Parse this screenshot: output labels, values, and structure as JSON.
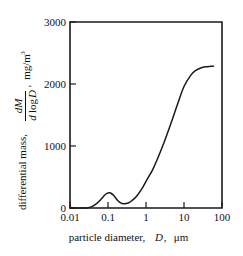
{
  "chart_data": {
    "type": "line",
    "title": "",
    "subtitle": "",
    "xlabel_parts": {
      "prefix": "particle diameter,",
      "symbol": "D",
      "comma": ",",
      "unit": "μm"
    },
    "xlabel": "particle diameter, D, μm",
    "ylabel_parts": {
      "prefix": "differential mass,",
      "numerator": "dM",
      "denominator_d": "d",
      "denominator_log": "log",
      "denominator_D": "D",
      "comma": ",",
      "unit_base": "mg/m",
      "unit_exponent": "3"
    },
    "ylabel": "differential mass, dM / d log D , mg/m3",
    "xscale": "log",
    "yscale": "linear",
    "xlim": [
      0.01,
      100
    ],
    "ylim": [
      0,
      3000
    ],
    "xticks": [
      "0.01",
      "0.1",
      "1",
      "10",
      "100"
    ],
    "xtick_values": [
      0.01,
      0.1,
      1,
      10,
      100
    ],
    "yticks": [
      "0",
      "1000",
      "2000",
      "3000"
    ],
    "ytick_values": [
      0,
      1000,
      2000,
      3000
    ],
    "grid": false,
    "legend": false,
    "series": [
      {
        "name": "differential mass distribution",
        "x": [
          0.01,
          0.02,
          0.03,
          0.04,
          0.05,
          0.06,
          0.07,
          0.08,
          0.09,
          0.1,
          0.11,
          0.12,
          0.14,
          0.16,
          0.18,
          0.2,
          0.22,
          0.25,
          0.3,
          0.35,
          0.4,
          0.5,
          0.6,
          0.8,
          1.0,
          1.5,
          2.0,
          3.0,
          4.0,
          5.0,
          7.0,
          10.0,
          15.0,
          20.0,
          30.0,
          40.0,
          50.0,
          60.0
        ],
        "y": [
          0,
          0,
          5,
          30,
          70,
          115,
          160,
          200,
          230,
          243,
          245,
          238,
          205,
          160,
          120,
          95,
          80,
          70,
          72,
          85,
          105,
          155,
          210,
          320,
          430,
          620,
          790,
          1060,
          1270,
          1440,
          1700,
          1960,
          2140,
          2215,
          2265,
          2280,
          2285,
          2288
        ]
      }
    ],
    "annotations": {
      "mode_1_peak_x": 0.11,
      "mode_1_peak_y": 245,
      "valley_x": 0.25,
      "valley_y": 70,
      "endpoint_x": 60,
      "endpoint_y": 2288
    },
    "colors": {
      "curve": "#1a1a1a",
      "axis": "#1a1a1a",
      "background": "#ffffff"
    }
  }
}
